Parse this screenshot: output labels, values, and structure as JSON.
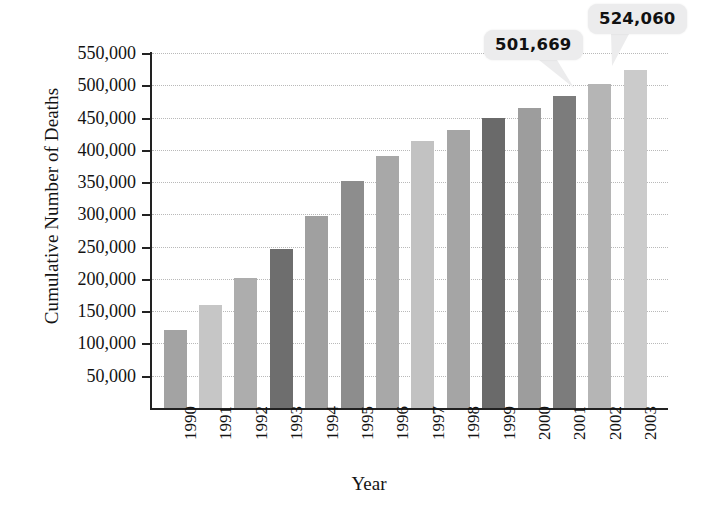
{
  "chart_data": {
    "type": "bar",
    "title": "",
    "xlabel": "Year",
    "ylabel": "Cumulative Number of Deaths",
    "categories": [
      "1990",
      "1991",
      "1992",
      "1993",
      "1994",
      "1995",
      "1996",
      "1997",
      "1998",
      "1999",
      "2000",
      "2001",
      "2002",
      "2003"
    ],
    "values": [
      121000,
      160000,
      202000,
      247000,
      298000,
      351000,
      390000,
      414000,
      431000,
      449000,
      465000,
      483000,
      501669,
      524060
    ],
    "ylim": [
      0,
      550000
    ],
    "ytick_labels": [
      "50,000",
      "100,000",
      "150,000",
      "200,000",
      "250,000",
      "300,000",
      "350,000",
      "400,000",
      "450,000",
      "500,000",
      "550,000"
    ],
    "ytick_values": [
      50000,
      100000,
      150000,
      200000,
      250000,
      300000,
      350000,
      400000,
      450000,
      500000,
      550000
    ],
    "grid": true,
    "legend": "none",
    "bar_colors": [
      "#a3a3a3",
      "#c6c6c6",
      "#adadad",
      "#6e6e6e",
      "#a0a0a0",
      "#8d8d8d",
      "#a8a8a8",
      "#c2c2c2",
      "#a5a5a5",
      "#6a6a6a",
      "#9d9d9d",
      "#7c7c7c",
      "#b5b5b5",
      "#cbcbcb"
    ],
    "annotations": [
      {
        "label": "501,669",
        "category": "2002",
        "value": 501669
      },
      {
        "label": "524,060",
        "category": "2003",
        "value": 524060
      }
    ]
  },
  "colors": {
    "axis": "#222222",
    "grid": "#b9b9b9",
    "callout_bg": "#ececed",
    "text": "#131313"
  }
}
